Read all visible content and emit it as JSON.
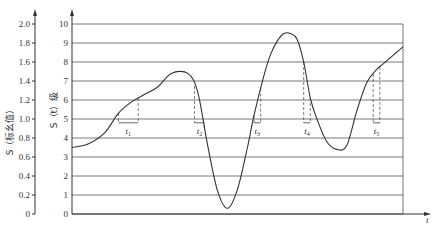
{
  "chart_data": {
    "type": "line",
    "title": "",
    "xlabel": "t",
    "ylabel_left": "S（标幺值）",
    "ylabel_right": "S（t）级",
    "left_axis": {
      "ticks": [
        "0",
        "0.2",
        "0.4",
        "0.6",
        "0.8",
        "1.0",
        "1.2",
        "1.4",
        "1.6",
        "1.8",
        "2.0"
      ],
      "ylim": [
        0,
        2.0
      ]
    },
    "right_axis": {
      "ticks": [
        "0",
        "1",
        "2",
        "3",
        "4",
        "5",
        "6",
        "7",
        "8",
        "9",
        "10"
      ],
      "ylim": [
        0,
        10
      ]
    },
    "grid": true,
    "series": [
      {
        "name": "S(t)",
        "x": [
          0,
          5,
          10,
          14,
          18,
          22,
          26,
          30,
          35,
          38,
          41,
          44,
          47,
          50,
          53,
          55,
          58,
          60,
          62,
          64,
          66,
          68,
          70,
          72,
          74,
          77,
          80,
          83,
          86,
          89,
          92,
          94,
          96,
          98,
          100
        ],
        "values": [
          3.5,
          3.7,
          4.3,
          5.3,
          5.9,
          6.3,
          6.7,
          7.4,
          7.4,
          6.4,
          3.6,
          1.2,
          0.3,
          1.3,
          3.5,
          5.2,
          7.3,
          8.4,
          9.1,
          9.5,
          9.5,
          9.2,
          8.0,
          6.1,
          5.0,
          3.8,
          3.4,
          3.6,
          5.4,
          6.9,
          7.6,
          7.9,
          8.2,
          8.5,
          8.8
        ]
      }
    ],
    "annotations": [
      {
        "label": "t1",
        "x_start": 14,
        "x_end": 20,
        "y": 4.8
      },
      {
        "label": "t2",
        "x_start": 37,
        "x_end": 40,
        "y": 4.8
      },
      {
        "label": "t3",
        "x_start": 55,
        "x_end": 57,
        "y": 4.8
      },
      {
        "label": "t4",
        "x_start": 70,
        "x_end": 72,
        "y": 4.8
      },
      {
        "label": "t5",
        "x_start": 91,
        "x_end": 93,
        "y": 4.8
      }
    ]
  }
}
